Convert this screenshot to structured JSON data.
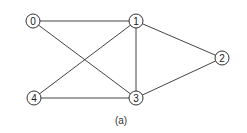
{
  "graph": {
    "caption": "(a)",
    "nodes": [
      {
        "id": "0",
        "label": "0",
        "x": 33,
        "y": 21
      },
      {
        "id": "1",
        "label": "1",
        "x": 136,
        "y": 21
      },
      {
        "id": "2",
        "label": "2",
        "x": 222,
        "y": 58
      },
      {
        "id": "3",
        "label": "3",
        "x": 136,
        "y": 98
      },
      {
        "id": "4",
        "label": "4",
        "x": 34,
        "y": 98
      }
    ],
    "edges": [
      {
        "from": "0",
        "to": "1"
      },
      {
        "from": "0",
        "to": "3"
      },
      {
        "from": "1",
        "to": "4"
      },
      {
        "from": "1",
        "to": "3"
      },
      {
        "from": "1",
        "to": "2"
      },
      {
        "from": "2",
        "to": "3"
      },
      {
        "from": "4",
        "to": "3"
      }
    ]
  },
  "colors": {
    "edge": "#444444",
    "node_stroke": "#333333",
    "background": "#ffffff"
  }
}
